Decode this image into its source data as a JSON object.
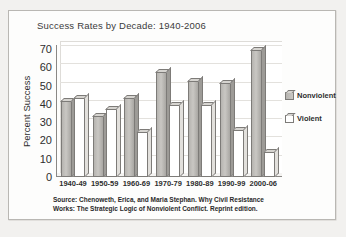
{
  "figure": {
    "source_note_line1": "Source: Chenoweth, Erica, and Maria Stephan. Why Civil Resistance",
    "source_note_line2": "Works: The Strategic Logic of Nonviolent Conflict. Reprint edition."
  },
  "chart_data": {
    "type": "bar",
    "title": "Success Rates by Decade: 1940-2006",
    "xlabel": "",
    "ylabel": "Percent Success",
    "ylim": [
      0,
      70
    ],
    "yticks": [
      0,
      10,
      20,
      30,
      40,
      50,
      60,
      70
    ],
    "grid": true,
    "legend_position": "right",
    "categories": [
      "1940-49",
      "1950-59",
      "1960-69",
      "1970-79",
      "1980-89",
      "1990-99",
      "2000-06"
    ],
    "series": [
      {
        "name": "Nonviolent",
        "color": "#bdbbb7",
        "values": [
          42,
          34,
          44,
          58,
          53,
          52,
          70
        ]
      },
      {
        "name": "Violent",
        "color": "#ffffff",
        "values": [
          44,
          38,
          25,
          40,
          40,
          26,
          14
        ]
      }
    ]
  }
}
